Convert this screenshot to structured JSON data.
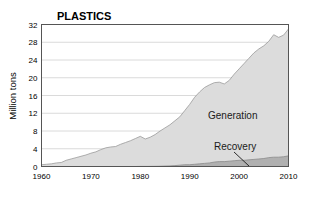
{
  "chart_data": {
    "type": "area",
    "title": "PLASTICS",
    "xlabel": "",
    "ylabel": "Million tons",
    "xlim": [
      1960,
      2010
    ],
    "ylim": [
      0,
      32
    ],
    "grid": true,
    "grid_axis": "y",
    "legend_position": "inline-annotations",
    "stacked": false,
    "x_ticks": [
      1960,
      1970,
      1980,
      1990,
      2000,
      2010
    ],
    "x_tick_labels": [
      "1960",
      "1970",
      "1980",
      "1990",
      "2000",
      "2010"
    ],
    "y_ticks": [
      0,
      4,
      8,
      12,
      16,
      20,
      24,
      28,
      32
    ],
    "y_tick_labels": [
      "0",
      "4",
      "8",
      "12",
      "16",
      "20",
      "24",
      "28",
      "32"
    ],
    "x": [
      1960,
      1961,
      1962,
      1963,
      1964,
      1965,
      1966,
      1967,
      1968,
      1969,
      1970,
      1971,
      1972,
      1973,
      1974,
      1975,
      1976,
      1977,
      1978,
      1979,
      1980,
      1981,
      1982,
      1983,
      1984,
      1985,
      1986,
      1987,
      1988,
      1989,
      1990,
      1991,
      1992,
      1993,
      1994,
      1995,
      1996,
      1997,
      1998,
      1999,
      2000,
      2001,
      2002,
      2003,
      2004,
      2005,
      2006,
      2007,
      2008,
      2009,
      2010
    ],
    "series": [
      {
        "name": "Generation",
        "color": "#dcdcdc",
        "line_color": "#9a9a9a",
        "values": [
          0.4,
          0.5,
          0.6,
          0.8,
          0.9,
          1.4,
          1.7,
          2.0,
          2.3,
          2.6,
          3.0,
          3.3,
          3.8,
          4.2,
          4.4,
          4.5,
          5.0,
          5.4,
          5.8,
          6.3,
          6.8,
          6.2,
          6.6,
          7.2,
          8.0,
          8.7,
          9.4,
          10.3,
          11.2,
          12.6,
          14.0,
          15.6,
          16.8,
          17.8,
          18.4,
          18.9,
          19.0,
          18.6,
          19.4,
          20.8,
          22.0,
          23.2,
          24.4,
          25.6,
          26.5,
          27.2,
          28.2,
          29.7,
          29.1,
          29.6,
          31.0
        ],
        "label_position": "inside-right"
      },
      {
        "name": "Recovery",
        "color": "#b0b0b0",
        "line_color": "#8a8a8a",
        "values": [
          0.0,
          0.0,
          0.0,
          0.0,
          0.0,
          0.0,
          0.0,
          0.0,
          0.0,
          0.0,
          0.0,
          0.0,
          0.0,
          0.0,
          0.0,
          0.0,
          0.0,
          0.0,
          0.0,
          0.0,
          0.02,
          0.02,
          0.03,
          0.04,
          0.06,
          0.1,
          0.14,
          0.2,
          0.3,
          0.4,
          0.4,
          0.5,
          0.6,
          0.7,
          0.8,
          1.0,
          1.1,
          1.1,
          1.2,
          1.3,
          1.4,
          1.4,
          1.5,
          1.6,
          1.7,
          1.8,
          2.0,
          2.1,
          2.1,
          2.2,
          2.4
        ],
        "label_position": "above-band"
      }
    ],
    "annotations": [
      {
        "text": "Generation",
        "x": 2000,
        "y": 12.5,
        "leader": false
      },
      {
        "text": "Recovery",
        "x": 2000,
        "y": 5.0,
        "leader": true
      }
    ],
    "colors": {
      "generation_fill": "#dcdcdc",
      "recovery_fill": "#b0b0b0",
      "axis": "#000000",
      "gridline": "#d0d0d0",
      "frame": "#555555",
      "background": "#ffffff"
    }
  }
}
